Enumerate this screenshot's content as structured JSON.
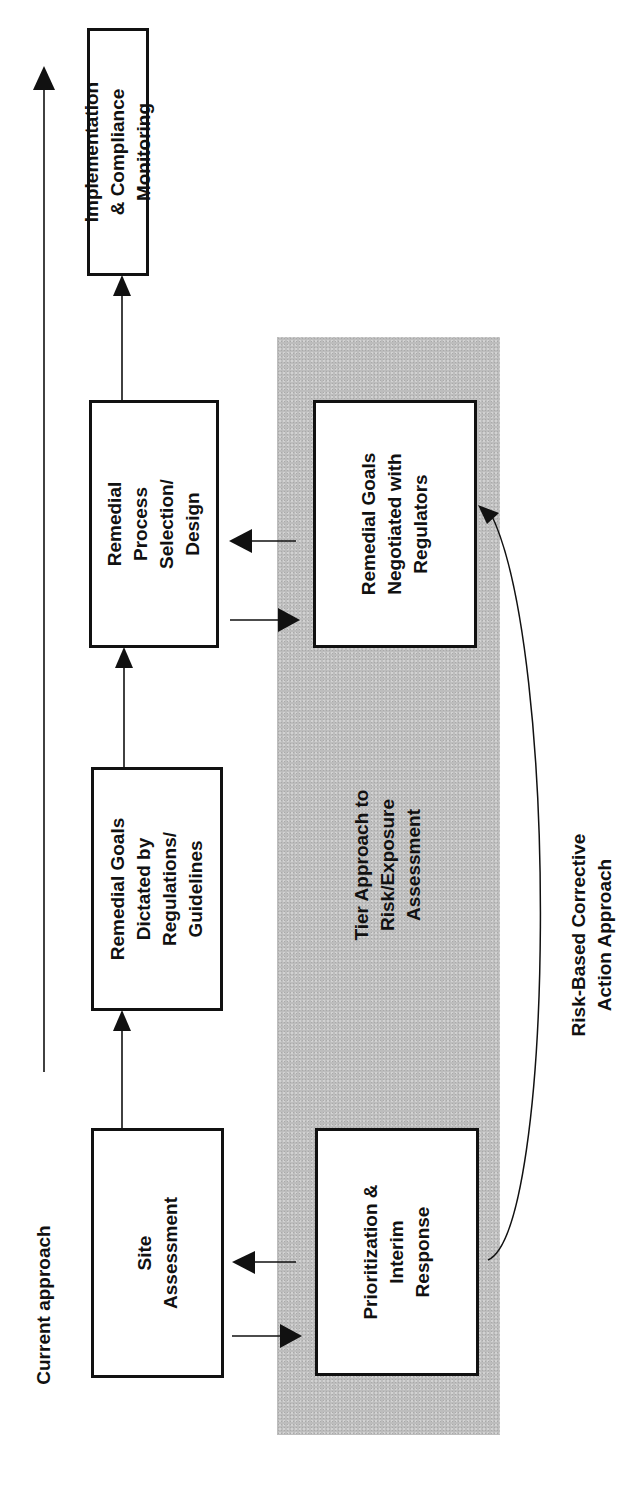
{
  "diagram": {
    "current_approach_label": "Current approach",
    "shaded_region_label": "Tier Approach to\nRisk/Exposure\nAssessment",
    "curve_label": "Risk-Based Corrective\nAction Approach",
    "boxes": {
      "site_assessment": "Site\nAssessment",
      "goals_dictated": "Remedial Goals\nDictated by\nRegulations/\nGuidelines",
      "process_selection": "Remedial\nProcess\nSelection/\nDesign",
      "implementation": "Implementation\n& Compliance\nMonitoring",
      "prioritization": "Prioritization &\nInterim\nResponse",
      "goals_negotiated": "Remedial Goals\nNegotiated with\nRegulators"
    },
    "colors": {
      "shade": "#bdbdbd",
      "ink": "#111111",
      "background": "#ffffff"
    },
    "orientation": "rotated -90deg (flow upward)"
  }
}
